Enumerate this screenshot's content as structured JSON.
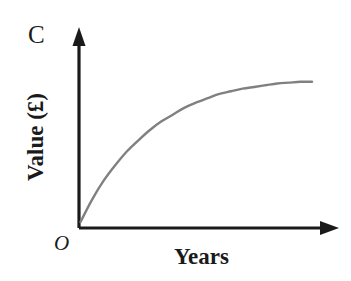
{
  "figure": {
    "background_color": "#ffffff",
    "axis_color": "#1a1a1a",
    "curve_color": "#808080",
    "labels": {
      "y_axis_cap": "C",
      "origin": "O",
      "y_axis_title": "Value (£)",
      "x_axis_title": "Years"
    }
  },
  "chart_data": {
    "type": "line",
    "title": "",
    "xlabel": "Years",
    "ylabel": "Value (£)",
    "annotations": [
      "C",
      "O"
    ],
    "grid": false,
    "legend": null,
    "axis_arrows": true,
    "tick_labels": {
      "x": [],
      "y": []
    },
    "xlim": [
      0,
      10
    ],
    "ylim": [
      0,
      10
    ],
    "series": [
      {
        "name": "Value over time",
        "color": "#808080",
        "x": [
          0,
          0.5,
          1,
          1.5,
          2,
          2.5,
          3,
          3.5,
          4,
          4.5,
          5,
          5.5,
          6,
          6.5,
          7,
          7.5,
          8,
          8.5,
          9,
          9.5,
          10
        ],
        "y": [
          0.35,
          1.65,
          2.75,
          3.65,
          4.45,
          5.1,
          5.7,
          6.2,
          6.6,
          7.0,
          7.3,
          7.55,
          7.8,
          7.95,
          8.1,
          8.2,
          8.3,
          8.4,
          8.45,
          8.5,
          8.5
        ]
      }
    ],
    "asymptote": {
      "label": "C",
      "y": 8.6
    }
  }
}
